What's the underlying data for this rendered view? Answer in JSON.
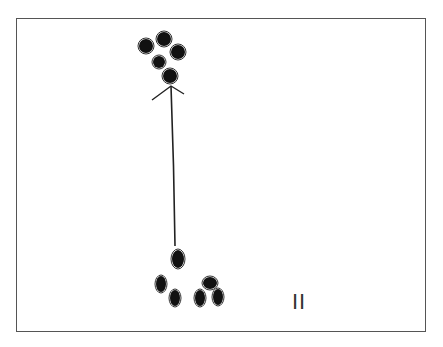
{
  "diagram": {
    "type": "hand-drawn sketch",
    "frame": {
      "x": 16,
      "y": 18,
      "w": 410,
      "h": 314,
      "stroke": "#555555"
    },
    "top_cluster": {
      "description": "group of 5 filled dots",
      "dots": [
        {
          "cx": 146,
          "cy": 46,
          "rx": 7,
          "ry": 7
        },
        {
          "cx": 164,
          "cy": 39,
          "rx": 7,
          "ry": 7
        },
        {
          "cx": 178,
          "cy": 52,
          "rx": 7,
          "ry": 7
        },
        {
          "cx": 159,
          "cy": 62,
          "rx": 6,
          "ry": 6
        },
        {
          "cx": 170,
          "cy": 76,
          "rx": 7,
          "ry": 7
        }
      ]
    },
    "bottom_cluster": {
      "description": "group of 6 filled dots",
      "dots": [
        {
          "cx": 178,
          "cy": 259,
          "rx": 6,
          "ry": 9
        },
        {
          "cx": 161,
          "cy": 284,
          "rx": 5,
          "ry": 8
        },
        {
          "cx": 175,
          "cy": 298,
          "rx": 5,
          "ry": 8
        },
        {
          "cx": 210,
          "cy": 283,
          "rx": 7,
          "ry": 6
        },
        {
          "cx": 200,
          "cy": 298,
          "rx": 5,
          "ry": 8
        },
        {
          "cx": 218,
          "cy": 297,
          "rx": 5,
          "ry": 8
        }
      ]
    },
    "arrow": {
      "x1": 175,
      "y1": 246,
      "x2": 171,
      "y2": 86,
      "stroke": "#222222",
      "direction": "up"
    },
    "tally_mark": "II",
    "tally_position": {
      "x": 292,
      "y": 289
    }
  }
}
